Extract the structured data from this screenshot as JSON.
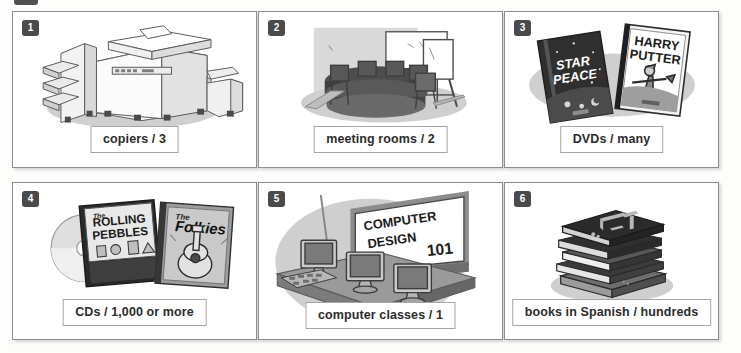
{
  "page": {
    "background_color": "#fdfdfc",
    "panel_border_color": "#8d8d8d",
    "badge_color": "#4a4a4a",
    "label_text_color": "#2c2c2c"
  },
  "panels": [
    {
      "number": "1",
      "label": "copiers / 3",
      "subject": "office-copier-illustration",
      "item": "copiers",
      "quantity": "3"
    },
    {
      "number": "2",
      "label": "meeting rooms / 2",
      "subject": "meeting-room-illustration",
      "item": "meeting rooms",
      "quantity": "2"
    },
    {
      "number": "3",
      "label": "DVDs / many",
      "subject": "dvd-cases-illustration",
      "item": "DVDs",
      "quantity": "many",
      "art_text": {
        "dvd_left_line1": "STAR",
        "dvd_left_line2": "PEACE",
        "dvd_right_line1": "HARRY",
        "dvd_right_line2": "PUTTER"
      }
    },
    {
      "number": "4",
      "label": "CDs / 1,000 or more",
      "subject": "cd-cases-illustration",
      "item": "CDs",
      "quantity": "1,000 or more",
      "art_text": {
        "cd_left_the": "The",
        "cd_left_line1": "ROLLING",
        "cd_left_line2": "PEBBLES",
        "cd_right_the": "The",
        "cd_right_line1": "Folkies"
      }
    },
    {
      "number": "5",
      "label": "computer classes / 1",
      "subject": "computer-lab-illustration",
      "item": "computer classes",
      "quantity": "1",
      "art_text": {
        "board_line1": "COMPUTER",
        "board_line2": "DESIGN",
        "board_line3": "101"
      }
    },
    {
      "number": "6",
      "label": "books in Spanish / hundreds",
      "subject": "book-stack-illustration",
      "item": "books in Spanish",
      "quantity": "hundreds"
    }
  ]
}
